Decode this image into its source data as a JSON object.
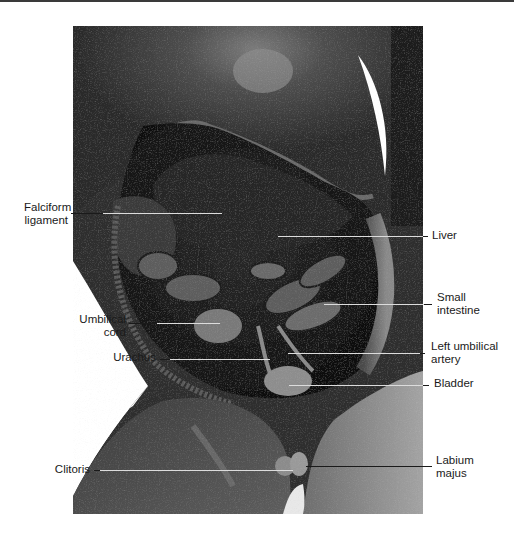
{
  "figure": {
    "colors": {
      "background": "#ffffff",
      "label_text": "#1a1a1a",
      "leader_dark": "#1a1a1a",
      "leader_light": "#dcdcdc",
      "photo_dark": "#1c1c1c",
      "photo_mid": "#5a5a5a",
      "photo_light": "#9a9a9a"
    }
  },
  "labels": {
    "falciform": {
      "line1": "Falciform",
      "line2": "ligament"
    },
    "liver": {
      "line1": "Liver"
    },
    "small_intestine": {
      "line1": "Small",
      "line2": "intestine"
    },
    "umbilical_cord": {
      "line1": "Umbilical",
      "line2": "cord"
    },
    "urachus": {
      "line1": "Urachus"
    },
    "left_umbilical_artery": {
      "line1": "Left umbilical",
      "line2": "artery"
    },
    "bladder": {
      "line1": "Bladder"
    },
    "clitoris": {
      "line1": "Clitoris"
    },
    "labium_majus": {
      "line1": "Labium",
      "line2": "majus"
    }
  }
}
